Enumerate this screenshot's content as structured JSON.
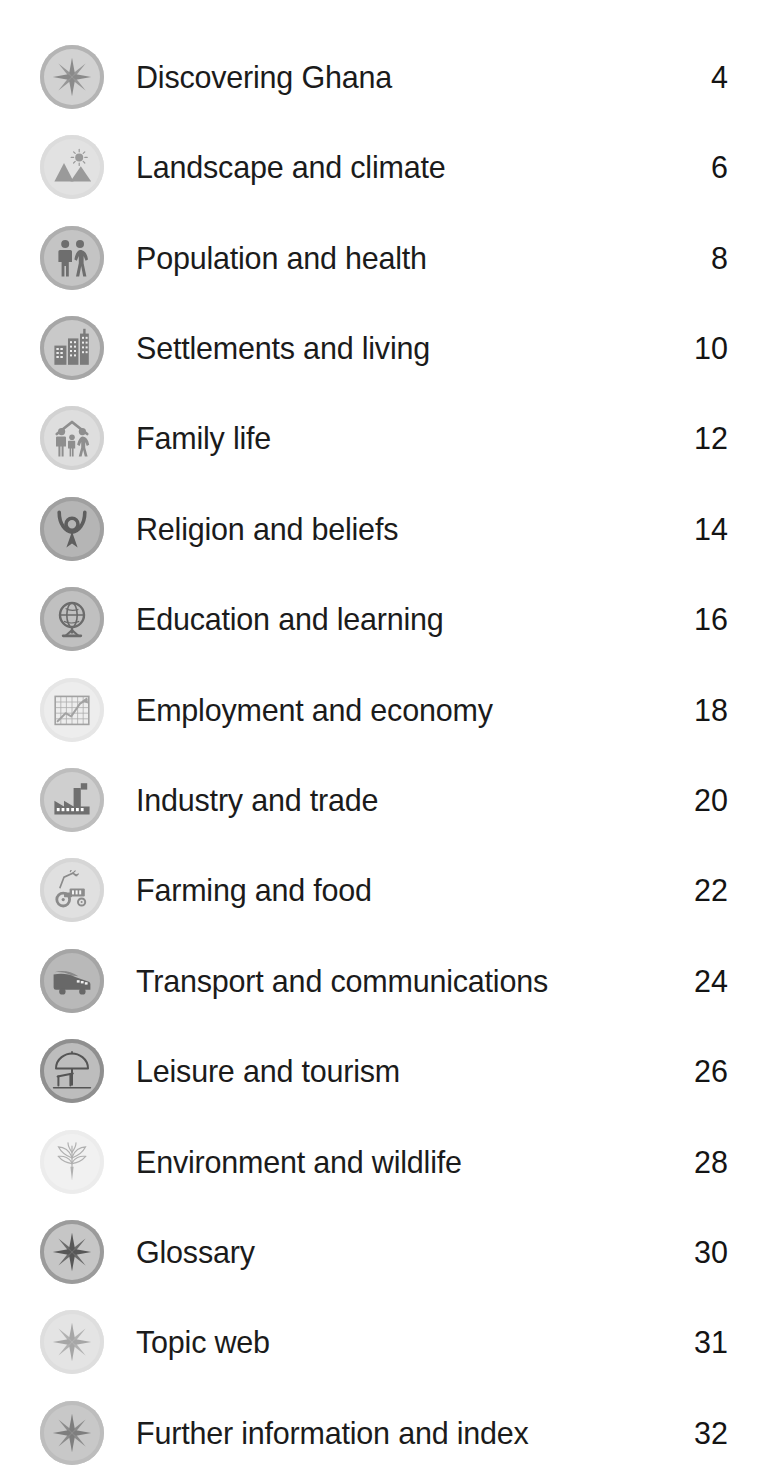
{
  "document": {
    "type": "table-of-contents",
    "page_background": "#ffffff",
    "text_color": "#1b1b1b"
  },
  "contents": {
    "entries": [
      {
        "label": "Discovering Ghana",
        "page": "4",
        "icon": "compass-rose-icon",
        "badge_fill": "#d2d2d2",
        "badge_ring": "#b4b4b4",
        "glyph_color": "#8a8a8a",
        "top": 32
      },
      {
        "label": "Landscape and climate",
        "page": "6",
        "icon": "mountains-sun-icon",
        "badge_fill": "#e2e2e2",
        "badge_ring": "#dcdcdc",
        "glyph_color": "#9a9a9a",
        "top": 122
      },
      {
        "label": "Population and health",
        "page": "8",
        "icon": "two-people-icon",
        "badge_fill": "#c4c4c4",
        "badge_ring": "#aeaeae",
        "glyph_color": "#6e6e6e",
        "top": 213
      },
      {
        "label": "Settlements and living",
        "page": "10",
        "icon": "city-buildings-icon",
        "badge_fill": "#c9c9c9",
        "badge_ring": "#a6a6a6",
        "glyph_color": "#7b7b7b",
        "top": 303
      },
      {
        "label": "Family life",
        "page": "12",
        "icon": "family-house-icon",
        "badge_fill": "#dedede",
        "badge_ring": "#d2d2d2",
        "glyph_color": "#8e8e8e",
        "top": 393
      },
      {
        "label": "Religion and beliefs",
        "page": "14",
        "icon": "praying-figure-icon",
        "badge_fill": "#b5b5b5",
        "badge_ring": "#a0a0a0",
        "glyph_color": "#5e5e5e",
        "top": 484
      },
      {
        "label": "Education and learning",
        "page": "16",
        "icon": "globe-stand-icon",
        "badge_fill": "#c0c0c0",
        "badge_ring": "#a8a8a8",
        "glyph_color": "#6b6b6b",
        "top": 574
      },
      {
        "label": "Employment and economy",
        "page": "18",
        "icon": "chart-graph-icon",
        "badge_fill": "#ededed",
        "badge_ring": "#e6e6e6",
        "glyph_color": "#a2a2a2",
        "top": 665
      },
      {
        "label": "Industry and trade",
        "page": "20",
        "icon": "factory-icon",
        "badge_fill": "#cfcfcf",
        "badge_ring": "#bdbdbd",
        "glyph_color": "#6f6f6f",
        "top": 755
      },
      {
        "label": "Farming and food",
        "page": "22",
        "icon": "tractor-icon",
        "badge_fill": "#e0e0e0",
        "badge_ring": "#d6d6d6",
        "glyph_color": "#8b8b8b",
        "top": 845
      },
      {
        "label": "Transport and communications",
        "page": "24",
        "icon": "vehicle-icon",
        "badge_fill": "#b9b9b9",
        "badge_ring": "#a5a5a5",
        "glyph_color": "#686868",
        "top": 936
      },
      {
        "label": "Leisure and tourism",
        "page": "26",
        "icon": "beach-parasol-icon",
        "badge_fill": "#bdbdbd",
        "badge_ring": "#8f8f8f",
        "glyph_color": "#555555",
        "top": 1026
      },
      {
        "label": "Environment and wildlife",
        "page": "28",
        "icon": "plant-leaves-icon",
        "badge_fill": "#f1f1f1",
        "badge_ring": "#ececec",
        "glyph_color": "#b0b0b0",
        "top": 1117
      },
      {
        "label": "Glossary",
        "page": "30",
        "icon": "compass-rose-icon",
        "badge_fill": "#c6c6c6",
        "badge_ring": "#9b9b9b",
        "glyph_color": "#575757",
        "top": 1207
      },
      {
        "label": "Topic web",
        "page": "31",
        "icon": "compass-rose-icon",
        "badge_fill": "#e4e4e4",
        "badge_ring": "#dedede",
        "glyph_color": "#a6a6a6",
        "top": 1297
      },
      {
        "label": "Further information and index",
        "page": "32",
        "icon": "compass-rose-icon",
        "badge_fill": "#c8c8c8",
        "badge_ring": "#bdbdbd",
        "glyph_color": "#7e7e7e",
        "top": 1388
      }
    ]
  }
}
